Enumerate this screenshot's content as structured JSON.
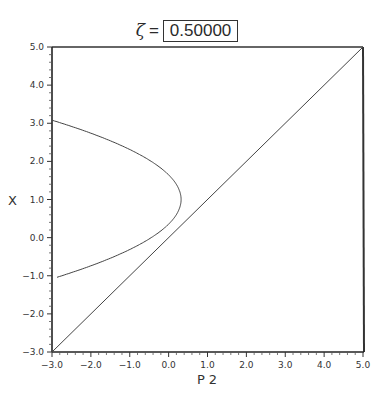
{
  "title": {
    "symbol": "ζ",
    "equals": "=",
    "value": "0.50000"
  },
  "axes": {
    "xlabel": "P 2",
    "ylabel": "X",
    "xticks": [
      "-3.0",
      "-2.0",
      "-1.0",
      "0.0",
      "1.0",
      "2.0",
      "3.0",
      "4.0",
      "5.0"
    ],
    "yticks": [
      "-3.0",
      "-2.0",
      "-1.0",
      "0.0",
      "1.0",
      "2.0",
      "3.0",
      "4.0",
      "5.0"
    ]
  },
  "chart_data": {
    "type": "line",
    "xlabel": "P 2",
    "ylabel": "X",
    "xlim": [
      -3.0,
      5.0
    ],
    "ylim": [
      -3.0,
      5.0
    ],
    "grid": false,
    "legend": null,
    "minor_ticks_per_major": 5,
    "series": [
      {
        "name": "diagonal",
        "description": "straight line X = P2",
        "points": [
          [
            -3.0,
            -3.0
          ],
          [
            5.0,
            5.0
          ]
        ]
      },
      {
        "name": "parabolic curve",
        "description": "curve opening to the left, tangent to diagonal near origin",
        "points": [
          [
            -3.0,
            3.08
          ],
          [
            -2.0,
            2.55
          ],
          [
            -1.0,
            2.1
          ],
          [
            0.0,
            1.6
          ],
          [
            0.3,
            1.0
          ],
          [
            0.0,
            0.35
          ],
          [
            -0.1,
            0.0
          ],
          [
            -1.0,
            -0.45
          ],
          [
            -2.0,
            -0.8
          ],
          [
            -3.0,
            -1.05
          ]
        ]
      }
    ]
  }
}
